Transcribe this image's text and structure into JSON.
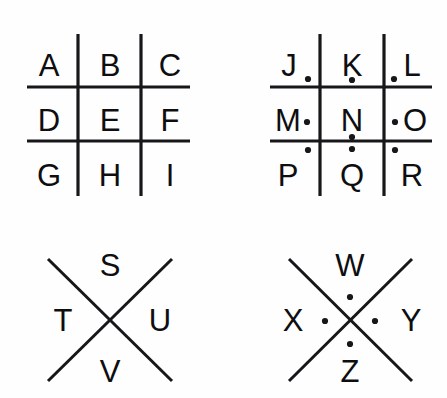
{
  "figure": {
    "stroke_color": "#17171a",
    "letter_color": "#0e0e11",
    "background_color": "#fefefe"
  },
  "groups": [
    {
      "id": "grid-plain",
      "type": "grid",
      "dotted": false,
      "letters": [
        "A",
        "B",
        "C",
        "D",
        "E",
        "F",
        "G",
        "H",
        "I"
      ]
    },
    {
      "id": "grid-dotted",
      "type": "grid",
      "dotted": true,
      "letters": [
        "J",
        "K",
        "L",
        "M",
        "N",
        "O",
        "P",
        "Q",
        "R"
      ]
    },
    {
      "id": "cross-plain",
      "type": "cross",
      "dotted": false,
      "letters": [
        "S",
        "T",
        "U",
        "V"
      ]
    },
    {
      "id": "cross-dotted",
      "type": "cross",
      "dotted": true,
      "letters": [
        "W",
        "X",
        "Y",
        "Z"
      ]
    }
  ],
  "grid_plain": {
    "cells": [
      {
        "letter": "A",
        "x": 49,
        "y": 76
      },
      {
        "letter": "B",
        "x": 110,
        "y": 76
      },
      {
        "letter": "C",
        "x": 170,
        "y": 76
      },
      {
        "letter": "D",
        "x": 49,
        "y": 131
      },
      {
        "letter": "E",
        "x": 110,
        "y": 131
      },
      {
        "letter": "F",
        "x": 170,
        "y": 131
      },
      {
        "letter": "G",
        "x": 49,
        "y": 186
      },
      {
        "letter": "H",
        "x": 110,
        "y": 186
      },
      {
        "letter": "I",
        "x": 170,
        "y": 186
      }
    ]
  },
  "grid_dotted": {
    "cells": [
      {
        "letter": "J",
        "x": 289,
        "y": 76
      },
      {
        "letter": "K",
        "x": 352,
        "y": 76
      },
      {
        "letter": "L",
        "x": 412,
        "y": 76
      },
      {
        "letter": "M",
        "x": 288,
        "y": 131
      },
      {
        "letter": "N",
        "x": 352,
        "y": 131
      },
      {
        "letter": "O",
        "x": 415,
        "y": 131
      },
      {
        "letter": "P",
        "x": 288,
        "y": 186
      },
      {
        "letter": "Q",
        "x": 352,
        "y": 186
      },
      {
        "letter": "R",
        "x": 412,
        "y": 186
      }
    ],
    "dots": [
      {
        "x": 308,
        "y": 79
      },
      {
        "x": 352,
        "y": 80
      },
      {
        "x": 394,
        "y": 79
      },
      {
        "x": 307,
        "y": 122
      },
      {
        "x": 352,
        "y": 137
      },
      {
        "x": 395,
        "y": 122
      },
      {
        "x": 308,
        "y": 150
      },
      {
        "x": 352,
        "y": 149
      },
      {
        "x": 395,
        "y": 150
      }
    ]
  },
  "cross_plain": {
    "letters": [
      {
        "letter": "S",
        "x": 110,
        "y": 276
      },
      {
        "letter": "T",
        "x": 63,
        "y": 331
      },
      {
        "letter": "U",
        "x": 160,
        "y": 331
      },
      {
        "letter": "V",
        "x": 110,
        "y": 382
      }
    ]
  },
  "cross_dotted": {
    "letters": [
      {
        "letter": "W",
        "x": 350,
        "y": 276
      },
      {
        "letter": "X",
        "x": 293,
        "y": 331
      },
      {
        "letter": "Y",
        "x": 411,
        "y": 331
      },
      {
        "letter": "Z",
        "x": 350,
        "y": 382
      }
    ],
    "dots": [
      {
        "x": 350,
        "y": 297
      },
      {
        "x": 325,
        "y": 321
      },
      {
        "x": 375,
        "y": 321
      },
      {
        "x": 350,
        "y": 344
      }
    ]
  },
  "geometry": {
    "grid_plain_lines": {
      "verticals": [
        {
          "x": 78,
          "y1": 34,
          "y2": 196
        },
        {
          "x": 141,
          "y1": 34,
          "y2": 196
        }
      ],
      "horizontals": [
        {
          "y": 87,
          "x1": 27,
          "x2": 190
        },
        {
          "y": 141,
          "x1": 27,
          "x2": 190
        }
      ]
    },
    "grid_dotted_lines": {
      "verticals": [
        {
          "x": 320,
          "y1": 34,
          "y2": 196
        },
        {
          "x": 384,
          "y1": 34,
          "y2": 196
        }
      ],
      "horizontals": [
        {
          "y": 87,
          "x1": 270,
          "x2": 432
        },
        {
          "y": 141,
          "x1": 270,
          "x2": 432
        }
      ]
    },
    "cross_plain_lines": [
      {
        "x1": 48,
        "y1": 259,
        "x2": 172,
        "y2": 381
      },
      {
        "x1": 172,
        "y1": 259,
        "x2": 48,
        "y2": 381
      }
    ],
    "cross_dotted_lines": [
      {
        "x1": 289,
        "y1": 259,
        "x2": 412,
        "y2": 381
      },
      {
        "x1": 412,
        "y1": 259,
        "x2": 289,
        "y2": 381
      }
    ],
    "dot_radius": 3.1
  }
}
